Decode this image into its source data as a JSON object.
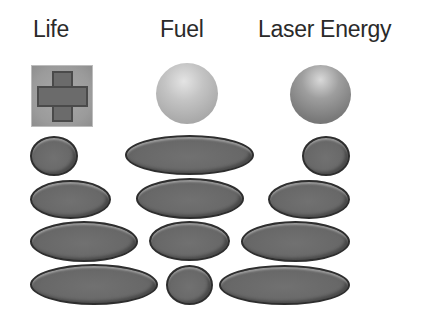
{
  "hud": {
    "columns": [
      {
        "id": "life",
        "label": "Life",
        "icon": "medical-cross-icon"
      },
      {
        "id": "fuel",
        "label": "Fuel",
        "icon": "fuel-sphere-icon"
      },
      {
        "id": "laser",
        "label": "Laser Energy",
        "icon": "energy-sphere-icon"
      }
    ],
    "colors": {
      "background": "#ffffff",
      "label_text": "#2a2a2a",
      "pill_fill": "#686868",
      "pill_outline": "#2e2e2e",
      "life_icon_bg": "#9b9b9b",
      "life_cross": "#6b6b6b",
      "fuel_sphere": "#c4c4c4",
      "laser_sphere": "#8a8a8a"
    },
    "bars": {
      "life": [
        {
          "row": 1,
          "width": 48
        },
        {
          "row": 2,
          "width": 81
        },
        {
          "row": 3,
          "width": 108
        },
        {
          "row": 4,
          "width": 128
        }
      ],
      "fuel": [
        {
          "row": 1,
          "width": 129
        },
        {
          "row": 2,
          "width": 108
        },
        {
          "row": 3,
          "width": 81
        },
        {
          "row": 4,
          "width": 47
        }
      ],
      "laser": [
        {
          "row": 1,
          "width": 48
        },
        {
          "row": 2,
          "width": 82
        },
        {
          "row": 3,
          "width": 109
        },
        {
          "row": 4,
          "width": 131
        }
      ]
    }
  }
}
